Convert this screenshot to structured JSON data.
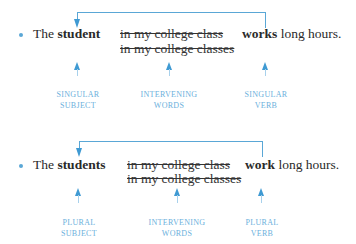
{
  "colors": {
    "accent": "#3f9ad3",
    "line": "#5aa7d6",
    "label": "#6bb0dc",
    "text": "#2a2a2a"
  },
  "examples": [
    {
      "article": "The",
      "subject": "student",
      "intervening_1": "in my college class",
      "intervening_2": "in my college classes",
      "verb": "works",
      "rest": "long hours.",
      "labels": {
        "subject": [
          "SINGULAR",
          "SUBJECT"
        ],
        "intervening": [
          "INTERVENING",
          "WORDS"
        ],
        "verb": [
          "SINGULAR",
          "VERB"
        ]
      }
    },
    {
      "article": "The",
      "subject": "students",
      "intervening_1": "in my college class",
      "intervening_2": "in my college classes",
      "verb": "work",
      "rest": "long hours.",
      "labels": {
        "subject": [
          "PLURAL",
          "SUBJECT"
        ],
        "intervening": [
          "INTERVENING",
          "WORDS"
        ],
        "verb": [
          "PLURAL",
          "VERB"
        ]
      }
    }
  ]
}
